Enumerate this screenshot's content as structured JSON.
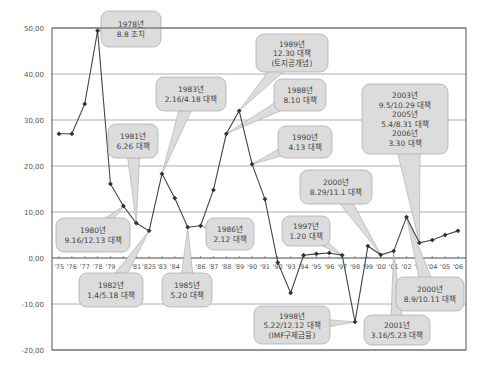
{
  "chart_data": {
    "type": "line",
    "title": "",
    "xlabel": "",
    "ylabel": "",
    "ylim": [
      -20,
      50
    ],
    "grid": true,
    "legend": "none",
    "y_ticks": [
      "50,00",
      "40,00",
      "30,00",
      "20,00",
      "10,00",
      "0,00",
      "-10,00",
      "-20,00"
    ],
    "y_tick_values": [
      50,
      40,
      30,
      20,
      10,
      0,
      -10,
      -20
    ],
    "categories": [
      "'75",
      "'76",
      "'77",
      "'78",
      "'79",
      "'80",
      "'81",
      "'825",
      "'83",
      "'84",
      "'85",
      "'86",
      "'87",
      "'88",
      "'89",
      "'90",
      "'91",
      "'92",
      "'93",
      "'94",
      "'95",
      "'96",
      "'97",
      "'98",
      "'99",
      "'00",
      "'01",
      "'02",
      "'03",
      "'04",
      "'05",
      "'06"
    ],
    "x_tick_labels": [
      "'75",
      "'76",
      "'77",
      "'78",
      "'79",
      "",
      "'81",
      "'825",
      "'83",
      "'84",
      "'85",
      "'86",
      "'87",
      "'88",
      "'89",
      "'90",
      "'91",
      "'92",
      "'93",
      "'94",
      "'95",
      "'96",
      "'97",
      "'98",
      "'99",
      "'00",
      "'01",
      "'02",
      "'03",
      "'04",
      "'05",
      "'06"
    ],
    "series": [
      {
        "name": "",
        "values": [
          27.0,
          27.0,
          33.5,
          49.4,
          16.1,
          11.3,
          7.6,
          5.9,
          18.3,
          13.0,
          6.7,
          7.0,
          14.8,
          27.0,
          32.0,
          20.4,
          12.8,
          -1.0,
          -7.6,
          0.6,
          0.9,
          1.1,
          0.6,
          -13.9,
          2.6,
          0.7,
          1.5,
          8.9,
          3.3,
          3.9,
          5.0,
          5.9
        ]
      }
    ],
    "annotations": [
      {
        "id": "a1978",
        "lines": [
          "1978년",
          "8.8 조치"
        ],
        "point_index": 3,
        "box": [
          101,
          11,
          60,
          36
        ]
      },
      {
        "id": "a1989",
        "lines": [
          "1989년",
          "12.30 대책",
          "(토지공개념)"
        ],
        "point_index": 14,
        "box": [
          256,
          34,
          72,
          38
        ]
      },
      {
        "id": "a1983",
        "lines": [
          "1983년",
          "2.16/4.18 대책"
        ],
        "point_index": 8,
        "box": [
          156,
          77,
          70,
          34
        ]
      },
      {
        "id": "a1988",
        "lines": [
          "1988년",
          "8.10 대책"
        ],
        "point_index": 13,
        "box": [
          274,
          79,
          52,
          32
        ]
      },
      {
        "id": "a1981",
        "lines": [
          "1981년",
          "6.26 대책"
        ],
        "point_index": 6,
        "box": [
          108,
          124,
          50,
          34
        ]
      },
      {
        "id": "a1990",
        "lines": [
          "1990년",
          "4.13 대책"
        ],
        "point_index": 15,
        "box": [
          278,
          126,
          54,
          32
        ]
      },
      {
        "id": "a2003",
        "lines": [
          "2003년",
          "9.5/10.29 대책",
          "2005년",
          "5.4/8.31 대책",
          "2006년",
          "3.30 대책"
        ],
        "point_index": 28,
        "box": [
          362,
          84,
          86,
          70
        ]
      },
      {
        "id": "a2000a",
        "lines": [
          "2000년",
          "8.29/11.1 대책"
        ],
        "point_index": 25,
        "box": [
          300,
          170,
          72,
          34
        ]
      },
      {
        "id": "a1980",
        "lines": [
          "1980년",
          "9.16/12.13 대책"
        ],
        "point_index": 5,
        "box": [
          56,
          218,
          74,
          34
        ]
      },
      {
        "id": "a1986",
        "lines": [
          "1986년",
          "2.12 대책"
        ],
        "point_index": 11,
        "box": [
          206,
          218,
          48,
          32
        ]
      },
      {
        "id": "a1997",
        "lines": [
          "1997년",
          "1.20 대책"
        ],
        "point_index": 22,
        "box": [
          282,
          216,
          48,
          30
        ]
      },
      {
        "id": "a1982",
        "lines": [
          "1982년",
          "1.4/5.18 대책"
        ],
        "point_index": 7,
        "box": [
          79,
          273,
          64,
          34
        ]
      },
      {
        "id": "a1985",
        "lines": [
          "1985년",
          "5.20 대책"
        ],
        "point_index": 10,
        "box": [
          162,
          273,
          50,
          34
        ]
      },
      {
        "id": "a2000b",
        "lines": [
          "2000년",
          "8.9/10.11 대책"
        ],
        "point_index": 27,
        "box": [
          396,
          277,
          68,
          34
        ]
      },
      {
        "id": "a1998",
        "lines": [
          "1998년",
          "5.22/12.12 대책",
          "(IMF구제금융)"
        ],
        "point_index": 23,
        "box": [
          254,
          306,
          76,
          38
        ]
      },
      {
        "id": "a2001",
        "lines": [
          "2001년",
          "3.16/5.23 대책"
        ],
        "point_index": 26,
        "box": [
          364,
          315,
          66,
          30
        ]
      }
    ]
  },
  "colors": {
    "line": "#444444",
    "marker": "#333333",
    "grid": "#9a9a9a",
    "axis": "#555555",
    "callout_fill": "#dcdcdc",
    "callout_stroke": "#a8a8a8",
    "text": "#555555"
  }
}
